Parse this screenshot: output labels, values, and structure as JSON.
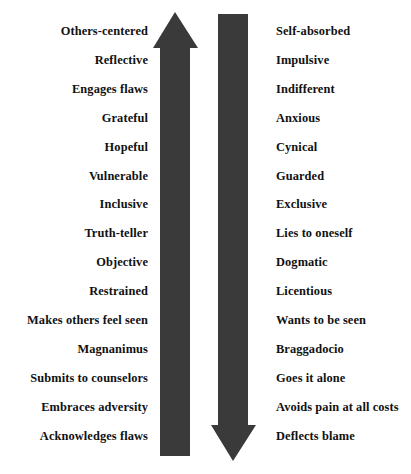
{
  "figure": {
    "type": "two-column-contrast-arrow-diagram",
    "background_color": "#ffffff",
    "text_color": "#111111",
    "arrow_color": "#3a3a3a",
    "rows": 15,
    "row_spacing_px": 28.9,
    "first_row_baseline_px": 34
  },
  "arrows": {
    "up": {
      "name": "upward-arrow",
      "direction": "up",
      "color": "#3a3a3a",
      "shaft_left_px": 160,
      "shaft_right_px": 190,
      "head_left_px": 153,
      "head_right_px": 198,
      "tip_y_px": 12,
      "head_base_y_px": 48,
      "shaft_bottom_y_px": 456
    },
    "down": {
      "name": "downward-arrow",
      "direction": "down",
      "color": "#3a3a3a",
      "shaft_left_px": 218,
      "shaft_right_px": 248,
      "head_left_px": 211,
      "head_right_px": 256,
      "tip_y_px": 461,
      "head_base_y_px": 425,
      "shaft_top_y_px": 14
    }
  },
  "left_column": {
    "name": "virtues-column",
    "align": "right",
    "items": [
      "Others-centered",
      "Reflective",
      "Engages flaws",
      "Grateful",
      "Hopeful",
      "Vulnerable",
      "Inclusive",
      "Truth-teller",
      "Objective",
      "Restrained",
      "Makes others feel seen",
      "Magnanimus",
      "Submits to counselors",
      "Embraces adversity",
      "Acknowledges flaws"
    ]
  },
  "right_column": {
    "name": "vices-column",
    "align": "left",
    "items": [
      "Self-absorbed",
      "Impulsive",
      "Indifferent",
      "Anxious",
      "Cynical",
      "Guarded",
      "Exclusive",
      "Lies to oneself",
      "Dogmatic",
      "Licentious",
      "Wants to be seen",
      "Braggadocio",
      "Goes it alone",
      "Avoids pain at all costs",
      "Deflects blame"
    ]
  }
}
